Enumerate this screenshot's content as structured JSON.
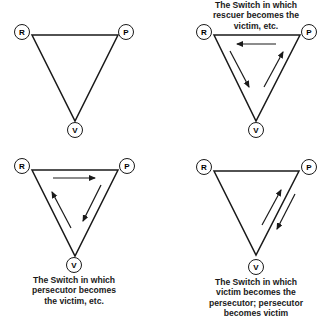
{
  "diagrams": [
    {
      "id": "base",
      "caption": [],
      "nodes": {
        "r": "R",
        "p": "P",
        "v": "V"
      },
      "arrows": []
    },
    {
      "id": "rescuer-switch",
      "caption": [
        "The Switch in which",
        "rescuer becomes the",
        "victim, etc."
      ],
      "nodes": {
        "r": "R",
        "p": "P",
        "v": "V"
      },
      "arrows": [
        "P→R (top, leftward)",
        "R→V (left side, downward)",
        "V→P (right side, upward)"
      ]
    },
    {
      "id": "persecutor-switch",
      "caption": [
        "The Switch in which",
        "persecutor becomes",
        "the victim, etc."
      ],
      "nodes": {
        "r": "R",
        "p": "P",
        "v": "V"
      },
      "arrows": [
        "R→P (top, rightward)",
        "P→V (right side, downward)",
        "V→R (left side, upward)"
      ]
    },
    {
      "id": "victim-switch",
      "caption": [
        "The Switch in which",
        "victim becomes the",
        "persecutor; persecutor",
        "becomes victim"
      ],
      "nodes": {
        "r": "R",
        "p": "P",
        "v": "V"
      },
      "arrows": [
        "V→P (right side, upward)",
        "P→V (right side, downward)"
      ]
    }
  ],
  "colors": {
    "stroke": "#1a1a1a",
    "background": "#ffffff"
  }
}
